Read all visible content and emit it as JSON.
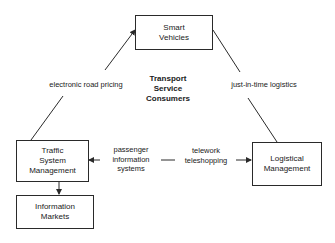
{
  "nodes": {
    "smart_vehicles": "Smart\nVehicles",
    "traffic_system_management": "Traffic\nSystem\nManagement",
    "logistical_management": "Logistical\nManagement",
    "information_markets": "Information\nMarkets"
  },
  "center_label": "Transport\nService\nConsumers",
  "edges": {
    "left": "electronic road pricing",
    "right": "just-in-time logistics",
    "bottom_left": "passenger\ninformation\nsystems",
    "bottom_right": "telework\nteleshopping"
  },
  "colors": {
    "line": "#2a2a2a",
    "background": "#ffffff"
  }
}
